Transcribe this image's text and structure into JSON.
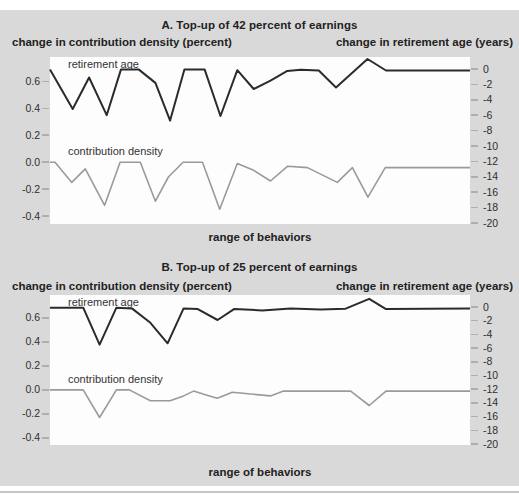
{
  "figure": {
    "colors": {
      "panel_bg": "#d9d9d9",
      "plot_bg": "#fdfdfd",
      "retirement_age_line": "#2b2b2b",
      "contribution_density_line": "#9a9a9a",
      "text": "#222222",
      "tick": "#aeaeae"
    }
  },
  "chart_data": [
    {
      "type": "line",
      "panel_id": "A",
      "title": "A. Top-up of 42 percent of earnings",
      "ylabel_left": "change in contribution density (percent)",
      "ylabel_right": "change in retirement age (years)",
      "xlabel": "range of behaviors",
      "x_note": "x values are normalized 0-1 positions along the unlabeled 'range of behaviors' axis",
      "left_axis": {
        "ticks": [
          0.6,
          0.4,
          0.2,
          0,
          -0.2,
          -0.4
        ],
        "tick_labels": [
          "0.6",
          "0.4",
          "0.2",
          "0.0",
          "-0.2",
          "-0.4"
        ],
        "range": [
          -0.44,
          0.72
        ]
      },
      "right_axis": {
        "ticks": [
          0,
          -2,
          -4,
          -6,
          -8,
          -10,
          -12,
          -14,
          -16,
          -18,
          -20
        ],
        "tick_labels": [
          "0",
          "-2",
          "-4",
          "-6",
          "-8",
          "-10",
          "-12",
          "-14",
          "-16",
          "-18",
          "-20"
        ],
        "range": [
          -20,
          1.7
        ]
      },
      "series": [
        {
          "name": "retirement age",
          "axis": "right",
          "units": "years",
          "color": "#2b2b2b",
          "points": [
            [
              0,
              -0.05
            ],
            [
              0.054,
              -5.2
            ],
            [
              0.093,
              -1.1
            ],
            [
              0.135,
              -6
            ],
            [
              0.169,
              -0.05
            ],
            [
              0.211,
              -0.05
            ],
            [
              0.251,
              -1.8
            ],
            [
              0.286,
              -6.7
            ],
            [
              0.32,
              -0.05
            ],
            [
              0.368,
              -0.05
            ],
            [
              0.406,
              -6.1
            ],
            [
              0.446,
              -0.15
            ],
            [
              0.485,
              -2.6
            ],
            [
              0.525,
              -1.5
            ],
            [
              0.565,
              -0.25
            ],
            [
              0.597,
              -0.1
            ],
            [
              0.64,
              -0.2
            ],
            [
              0.681,
              -2.4
            ],
            [
              0.756,
              1.3
            ],
            [
              0.8,
              -0.2
            ],
            [
              1,
              -0.2
            ]
          ]
        },
        {
          "name": "contribution density",
          "axis": "left",
          "units": "percent",
          "color": "#9a9a9a",
          "points": [
            [
              0,
              0
            ],
            [
              0.012,
              0
            ],
            [
              0.052,
              -0.15
            ],
            [
              0.084,
              -0.05
            ],
            [
              0.13,
              -0.32
            ],
            [
              0.167,
              0
            ],
            [
              0.215,
              0
            ],
            [
              0.251,
              -0.29
            ],
            [
              0.282,
              -0.11
            ],
            [
              0.317,
              0
            ],
            [
              0.363,
              0
            ],
            [
              0.404,
              -0.35
            ],
            [
              0.446,
              -0.01
            ],
            [
              0.485,
              -0.06
            ],
            [
              0.525,
              -0.14
            ],
            [
              0.566,
              -0.03
            ],
            [
              0.613,
              -0.04
            ],
            [
              0.684,
              -0.15
            ],
            [
              0.72,
              -0.04
            ],
            [
              0.757,
              -0.26
            ],
            [
              0.798,
              -0.04
            ],
            [
              1,
              -0.04
            ]
          ]
        }
      ]
    },
    {
      "type": "line",
      "panel_id": "B",
      "title": "B. Top-up of 25 percent of earnings",
      "ylabel_left": "change in contribution density (percent)",
      "ylabel_right": "change in retirement age (years)",
      "xlabel": "range of behaviors",
      "x_note": "x values are normalized 0-1 positions along the unlabeled 'range of behaviors' axis",
      "left_axis": {
        "ticks": [
          0.6,
          0.4,
          0.2,
          0,
          -0.2,
          -0.4
        ],
        "tick_labels": [
          "0.6",
          "0.4",
          "0.2",
          "0.0",
          "-0.2",
          "-0.4"
        ],
        "range": [
          -0.44,
          0.72
        ]
      },
      "right_axis": {
        "ticks": [
          0,
          -2,
          -4,
          -6,
          -8,
          -10,
          -12,
          -14,
          -16,
          -18,
          -20
        ],
        "tick_labels": [
          "0",
          "-2",
          "-4",
          "-6",
          "-8",
          "-10",
          "-12",
          "-14",
          "-16",
          "-18",
          "-20"
        ],
        "range": [
          -20,
          1.7
        ]
      },
      "series": [
        {
          "name": "retirement age",
          "axis": "right",
          "units": "years",
          "color": "#2b2b2b",
          "points": [
            [
              0,
              -0.1
            ],
            [
              0.079,
              -0.1
            ],
            [
              0.118,
              -5.5
            ],
            [
              0.158,
              -0.1
            ],
            [
              0.195,
              -0.2
            ],
            [
              0.239,
              -2.3
            ],
            [
              0.28,
              -5.3
            ],
            [
              0.318,
              -0.2
            ],
            [
              0.352,
              -0.3
            ],
            [
              0.399,
              -1.9
            ],
            [
              0.438,
              -0.3
            ],
            [
              0.505,
              -0.5
            ],
            [
              0.573,
              -0.2
            ],
            [
              0.644,
              -0.35
            ],
            [
              0.704,
              -0.25
            ],
            [
              0.76,
              1.2
            ],
            [
              0.8,
              -0.3
            ],
            [
              1,
              -0.2
            ]
          ]
        },
        {
          "name": "contribution density",
          "axis": "left",
          "units": "percent",
          "color": "#9a9a9a",
          "points": [
            [
              0,
              0
            ],
            [
              0.079,
              0
            ],
            [
              0.118,
              -0.23
            ],
            [
              0.158,
              0
            ],
            [
              0.189,
              0
            ],
            [
              0.239,
              -0.09
            ],
            [
              0.286,
              -0.09
            ],
            [
              0.318,
              -0.05
            ],
            [
              0.342,
              -0.01
            ],
            [
              0.37,
              -0.04
            ],
            [
              0.398,
              -0.07
            ],
            [
              0.434,
              -0.02
            ],
            [
              0.525,
              -0.05
            ],
            [
              0.556,
              -0.01
            ],
            [
              0.716,
              -0.01
            ],
            [
              0.76,
              -0.13
            ],
            [
              0.8,
              -0.01
            ],
            [
              1,
              -0.01
            ]
          ]
        }
      ]
    }
  ]
}
